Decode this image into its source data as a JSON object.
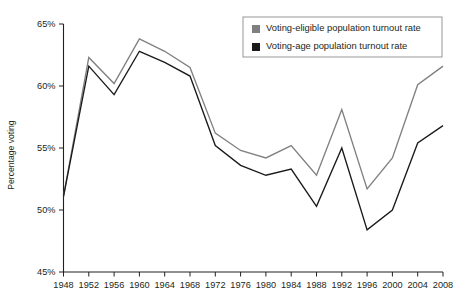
{
  "chart_data": {
    "type": "line",
    "title": "",
    "xlabel": "",
    "ylabel": "Percentage voting",
    "x": [
      1948,
      1952,
      1956,
      1960,
      1964,
      1968,
      1972,
      1976,
      1980,
      1984,
      1988,
      1992,
      1996,
      2000,
      2004,
      2008
    ],
    "xtick_labels": [
      "1948",
      "1952",
      "1956",
      "1960",
      "1964",
      "1968",
      "1972",
      "1976",
      "1980",
      "1984",
      "1988",
      "1992",
      "1996",
      "2000",
      "2004",
      "2008"
    ],
    "ytick_labels": [
      "65%",
      "60%",
      "55%",
      "50%",
      "45%"
    ],
    "ytick_values": [
      65,
      60,
      55,
      50,
      45
    ],
    "ylim": [
      45,
      65
    ],
    "xlim": [
      1948,
      2008
    ],
    "grid": false,
    "legend_position": "top-right",
    "series": [
      {
        "name": "Voting-eligible population turnout rate",
        "color": "#808080",
        "values": [
          51.1,
          62.3,
          60.2,
          63.8,
          62.8,
          61.5,
          56.2,
          54.8,
          54.2,
          55.2,
          52.8,
          58.1,
          51.7,
          54.2,
          60.1,
          61.6
        ]
      },
      {
        "name": "Voting-age population turnout rate",
        "color": "#1a1a1a",
        "values": [
          51.1,
          61.6,
          59.3,
          62.8,
          61.9,
          60.8,
          55.2,
          53.6,
          52.8,
          53.3,
          50.3,
          55.0,
          48.4,
          50.0,
          55.4,
          56.8
        ]
      }
    ]
  },
  "legend": {
    "items": [
      {
        "label": "Voting-eligible population turnout rate",
        "swatch": "#808080"
      },
      {
        "label": "Voting-age population turnout rate",
        "swatch": "#1a1a1a"
      }
    ]
  },
  "axis": {
    "y_title": "Percentage voting"
  }
}
